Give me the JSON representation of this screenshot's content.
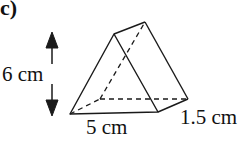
{
  "diagram": {
    "part_label": "c)",
    "shape": "triangular prism",
    "dimensions": {
      "height": "6 cm",
      "base": "5 cm",
      "depth": "1.5 cm"
    },
    "colors": {
      "line": "#1a1a1a",
      "background": "#ffffff"
    }
  }
}
